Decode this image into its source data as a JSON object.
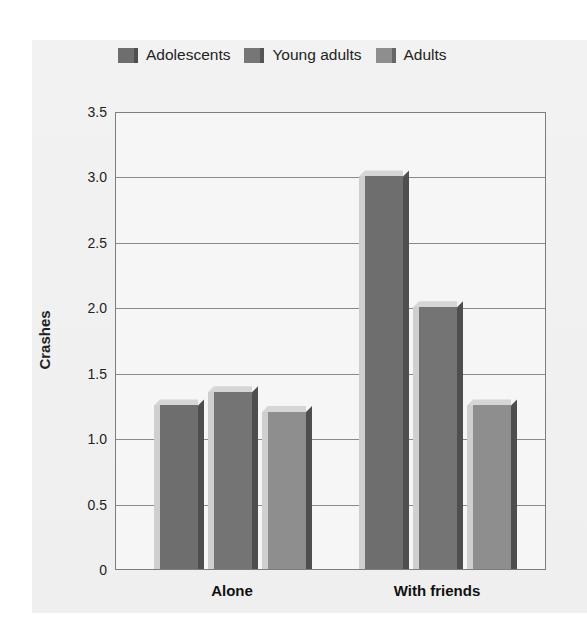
{
  "chart_data": {
    "type": "bar",
    "title": "",
    "xlabel": "",
    "ylabel": "Crashes",
    "ylim": [
      0,
      3.5
    ],
    "yticks": [
      "0",
      "0.5",
      "1.0",
      "1.5",
      "2.0",
      "2.5",
      "3.0",
      "3.5"
    ],
    "grid": true,
    "legend_position": "top",
    "categories": [
      "Alone",
      "With friends"
    ],
    "series": [
      {
        "name": "Adolescents",
        "color": "#6e6e6e",
        "values": [
          1.25,
          3.0
        ]
      },
      {
        "name": "Young adults",
        "color": "#747474",
        "values": [
          1.35,
          2.0
        ]
      },
      {
        "name": "Adults",
        "color": "#8e8e8e",
        "values": [
          1.2,
          1.25
        ]
      }
    ]
  },
  "legend": {
    "items": [
      "Adolescents",
      "Young adults",
      "Adults"
    ]
  },
  "axis": {
    "ylabel": "Crashes",
    "yticks": [
      "0",
      "0.5",
      "1.0",
      "1.5",
      "2.0",
      "2.5",
      "3.0",
      "3.5"
    ],
    "xticks": [
      "Alone",
      "With friends"
    ]
  }
}
